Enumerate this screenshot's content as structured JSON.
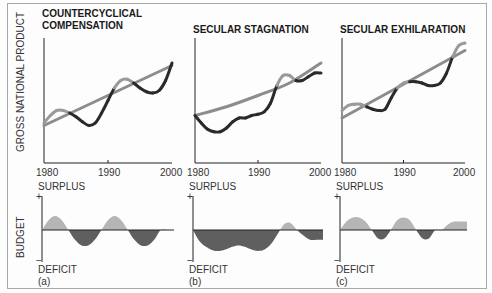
{
  "chart_data": [
    {
      "type": "line",
      "panel": "a",
      "title": [
        "COUNTERCYCLICAL",
        "COMPENSATION"
      ],
      "ylabel": "GROSS NATIONAL PRODUCT",
      "x_ticks": [
        "1980",
        "1990",
        "2000"
      ],
      "xlim": [
        1980,
        2000
      ],
      "series": [
        {
          "name": "trend",
          "style": "gray",
          "x": [
            1980,
            2000
          ],
          "y": [
            0.3,
            0.78
          ]
        },
        {
          "name": "actual",
          "style": "alternating",
          "x": [
            1980,
            1981,
            1982,
            1983,
            1984,
            1985,
            1986,
            1987,
            1988,
            1989,
            1990,
            1991,
            1992,
            1993,
            1994,
            1995,
            1996,
            1997,
            1998,
            1999,
            2000
          ],
          "y": [
            0.32,
            0.38,
            0.42,
            0.42,
            0.4,
            0.37,
            0.33,
            0.3,
            0.32,
            0.4,
            0.5,
            0.6,
            0.66,
            0.67,
            0.64,
            0.6,
            0.57,
            0.56,
            0.58,
            0.66,
            0.8
          ]
        }
      ],
      "budget": {
        "ylabel": "BUDGET",
        "top_label": "SURPLUS",
        "bottom_label": "DEFICIT",
        "plus": "+",
        "minus": "−",
        "panel_label": "(a)",
        "x": [
          0,
          0.05,
          0.1,
          0.15,
          0.2,
          0.25,
          0.3,
          0.35,
          0.4,
          0.45,
          0.5,
          0.55,
          0.6,
          0.65,
          0.7,
          0.75,
          0.8,
          0.85,
          0.9,
          0.95,
          1.0
        ],
        "y": [
          0,
          0.35,
          0.5,
          0.35,
          0,
          -0.35,
          -0.55,
          -0.55,
          -0.35,
          0,
          0.35,
          0.5,
          0.35,
          0,
          -0.35,
          -0.55,
          -0.55,
          -0.35,
          0,
          0,
          0
        ]
      }
    },
    {
      "type": "line",
      "panel": "b",
      "title": [
        "SECULAR STAGNATION"
      ],
      "x_ticks": [
        "1980",
        "1990",
        "2000"
      ],
      "xlim": [
        1980,
        2000
      ],
      "series": [
        {
          "name": "trend",
          "style": "gray",
          "x": [
            1980,
            1985,
            1990,
            1995,
            2000
          ],
          "y": [
            0.38,
            0.45,
            0.54,
            0.64,
            0.8
          ]
        },
        {
          "name": "actual",
          "style": "alternating",
          "x": [
            1980,
            1981,
            1982,
            1983,
            1984,
            1985,
            1986,
            1987,
            1988,
            1989,
            1990,
            1991,
            1992,
            1993,
            1994,
            1995,
            1996,
            1997,
            1998,
            1999,
            2000
          ],
          "y": [
            0.38,
            0.32,
            0.27,
            0.25,
            0.25,
            0.28,
            0.33,
            0.36,
            0.36,
            0.38,
            0.39,
            0.41,
            0.48,
            0.62,
            0.7,
            0.7,
            0.66,
            0.66,
            0.69,
            0.72,
            0.72
          ]
        }
      ],
      "budget": {
        "top_label": "SURPLUS",
        "bottom_label": "DEFICIT",
        "plus": "+",
        "minus": "−",
        "panel_label": "(b)",
        "x": [
          0,
          0.05,
          0.1,
          0.15,
          0.2,
          0.25,
          0.3,
          0.35,
          0.4,
          0.45,
          0.5,
          0.55,
          0.6,
          0.65,
          0.7,
          0.75,
          0.8,
          0.85,
          0.9,
          0.95,
          1.0
        ],
        "y": [
          0,
          -0.4,
          -0.6,
          -0.72,
          -0.75,
          -0.7,
          -0.6,
          -0.55,
          -0.6,
          -0.7,
          -0.75,
          -0.7,
          -0.5,
          -0.15,
          0.2,
          0.25,
          0,
          -0.2,
          -0.35,
          -0.35,
          -0.35
        ]
      }
    },
    {
      "type": "line",
      "panel": "c",
      "title": [
        "SECULAR EXHILARATION"
      ],
      "x_ticks": [
        "1980",
        "1990",
        "2000"
      ],
      "xlim": [
        1980,
        2000
      ],
      "series": [
        {
          "name": "trend",
          "style": "gray",
          "x": [
            1980,
            2000
          ],
          "y": [
            0.36,
            0.9
          ]
        },
        {
          "name": "actual",
          "style": "alternating",
          "x": [
            1980,
            1981,
            1982,
            1983,
            1984,
            1985,
            1986,
            1987,
            1988,
            1989,
            1990,
            1991,
            1992,
            1993,
            1994,
            1995,
            1996,
            1997,
            1998,
            1999,
            2000
          ],
          "y": [
            0.42,
            0.46,
            0.47,
            0.47,
            0.45,
            0.43,
            0.42,
            0.43,
            0.52,
            0.6,
            0.64,
            0.65,
            0.65,
            0.64,
            0.62,
            0.62,
            0.64,
            0.72,
            0.85,
            0.94,
            0.96
          ]
        }
      ],
      "budget": {
        "top_label": "SURPLUS",
        "bottom_label": "DEFICIT",
        "plus": "+",
        "minus": "−",
        "panel_label": "(c)",
        "x": [
          0,
          0.05,
          0.1,
          0.15,
          0.2,
          0.25,
          0.3,
          0.35,
          0.4,
          0.45,
          0.5,
          0.55,
          0.6,
          0.65,
          0.7,
          0.75,
          0.8,
          0.85,
          0.9,
          0.95,
          1.0
        ],
        "y": [
          0,
          0.3,
          0.45,
          0.45,
          0.3,
          0,
          -0.3,
          -0.3,
          0,
          0.35,
          0.45,
          0.35,
          0,
          -0.3,
          -0.3,
          0,
          0,
          0.2,
          0.3,
          0.3,
          0.3
        ]
      }
    }
  ],
  "colors": {
    "trend": "#8c8c8c",
    "actual_dark": "#2a2a2a",
    "actual_light": "#9a9a9a",
    "surplus": "#b5b5b5",
    "deficit": "#5f5f5f",
    "axis": "#222222"
  }
}
